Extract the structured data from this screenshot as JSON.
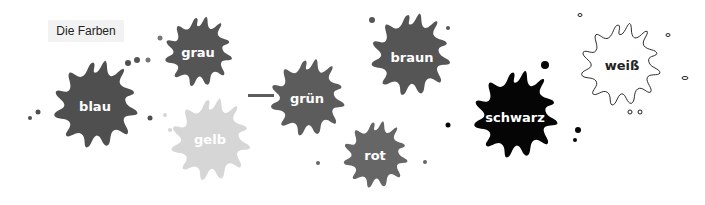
{
  "title": "Die Farben",
  "splats": [
    {
      "label": "blau",
      "color": "#4f4f4f",
      "text_color": "#ffffff"
    },
    {
      "label": "grau",
      "color": "#555555",
      "text_color": "#ffffff"
    },
    {
      "label": "gelb",
      "color": "#d6d6d6",
      "text_color": "#ffffff"
    },
    {
      "label": "grün",
      "color": "#5c5c5c",
      "text_color": "#ffffff"
    },
    {
      "label": "rot",
      "color": "#666666",
      "text_color": "#ffffff"
    },
    {
      "label": "braun",
      "color": "#555555",
      "text_color": "#ffffff"
    },
    {
      "label": "schwarz",
      "color": "#050505",
      "text_color": "#ffffff"
    },
    {
      "label": "weiß",
      "color": "#ffffff",
      "text_color": "#222222"
    }
  ]
}
